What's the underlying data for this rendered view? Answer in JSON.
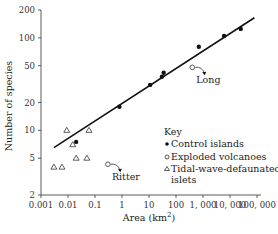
{
  "chart_data": {
    "type": "scatter",
    "title": "",
    "xlabel": "Area (km²)",
    "xlabel_base": "Area (km",
    "xlabel_sup": "2",
    "xlabel_close": ")",
    "ylabel": "Number of species",
    "xscale": "log",
    "yscale": "log",
    "xlim": [
      0.001,
      100000
    ],
    "ylim": [
      2,
      200
    ],
    "grid": false,
    "x_ticks": [
      {
        "value": 0.001,
        "label": "0.001"
      },
      {
        "value": 0.01,
        "label": "0.01"
      },
      {
        "value": 0.1,
        "label": "0.1"
      },
      {
        "value": 1,
        "label": "1"
      },
      {
        "value": 10,
        "label": "10"
      },
      {
        "value": 100,
        "label": "100"
      },
      {
        "value": 1000,
        "label": "1, 000"
      },
      {
        "value": 10000,
        "label": "10, 000"
      },
      {
        "value": 100000,
        "label": "100, 000"
      }
    ],
    "y_ticks": [
      {
        "value": 2,
        "label": "2"
      },
      {
        "value": 5,
        "label": "5"
      },
      {
        "value": 10,
        "label": "10"
      },
      {
        "value": 20,
        "label": "20"
      },
      {
        "value": 50,
        "label": "50"
      },
      {
        "value": 100,
        "label": "100"
      },
      {
        "value": 200,
        "label": "200"
      }
    ],
    "series": [
      {
        "name": "Control islands",
        "marker": "filled-circle",
        "points": [
          {
            "x": 0.02,
            "y": 7.5
          },
          {
            "x": 0.8,
            "y": 18
          },
          {
            "x": 11,
            "y": 31
          },
          {
            "x": 30,
            "y": 38
          },
          {
            "x": 35,
            "y": 42
          },
          {
            "x": 700,
            "y": 80
          },
          {
            "x": 6000,
            "y": 105
          },
          {
            "x": 25000,
            "y": 125
          }
        ]
      },
      {
        "name": "Exploded volcanoes",
        "marker": "open-circle",
        "points": [
          {
            "x": 0.3,
            "y": 4.3,
            "label": "Ritter"
          },
          {
            "x": 400,
            "y": 48,
            "label": "Long"
          }
        ]
      },
      {
        "name": "Tidal-wave-defaunated islets",
        "marker": "open-triangle",
        "points": [
          {
            "x": 0.003,
            "y": 4
          },
          {
            "x": 0.006,
            "y": 4
          },
          {
            "x": 0.009,
            "y": 10
          },
          {
            "x": 0.015,
            "y": 7
          },
          {
            "x": 0.02,
            "y": 5
          },
          {
            "x": 0.05,
            "y": 5
          },
          {
            "x": 0.06,
            "y": 10
          }
        ]
      }
    ],
    "fit_line": {
      "x_start": 0.003,
      "y_start": 6.5,
      "x_end": 80000,
      "y_end": 165
    },
    "legend": {
      "title": "Key",
      "entries": [
        {
          "label": "Control islands",
          "marker": "filled-circle"
        },
        {
          "label": "Exploded volcanoes",
          "marker": "open-circle"
        },
        {
          "label": "Tidal-wave-defaunated",
          "marker": "open-triangle"
        },
        {
          "label": "islets",
          "marker": ""
        }
      ],
      "position": "lower-right"
    },
    "annotations": [
      {
        "text": "Ritter",
        "target": "Exploded volcanoes 0.3"
      },
      {
        "text": "Long",
        "target": "Exploded volcanoes 400"
      }
    ]
  }
}
